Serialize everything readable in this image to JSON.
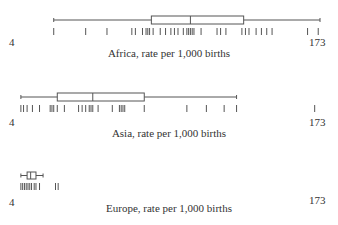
{
  "chart_data": [
    {
      "type": "boxplot",
      "title": "Africa, rate per 1,000 births",
      "axis_min": 4,
      "axis_max": 173,
      "box": {
        "min": 23,
        "q1": 78,
        "median": 100,
        "q3": 130,
        "max": 173
      },
      "rug": [
        23,
        41,
        53,
        67,
        69,
        73,
        75,
        76,
        77,
        79,
        83,
        86,
        89,
        91,
        93,
        96,
        98,
        99,
        100,
        101,
        102,
        106,
        115,
        117,
        120,
        129,
        131,
        133,
        137,
        140,
        143,
        146,
        166,
        172
      ]
    },
    {
      "type": "boxplot",
      "title": "Asia, rate per 1,000 births",
      "axis_min": 4,
      "axis_max": 173,
      "box": {
        "min": 4.5,
        "q1": 25,
        "median": 45,
        "q3": 74,
        "max": 126
      },
      "outliers": [
        170
      ],
      "rug": [
        4.5,
        6,
        8,
        11,
        15,
        21,
        22,
        23,
        25,
        29,
        37,
        39,
        41,
        43,
        44,
        45,
        48,
        56,
        60,
        61,
        62,
        63,
        74,
        98,
        109,
        119,
        126,
        170
      ]
    },
    {
      "type": "boxplot",
      "title": "Europe, rate per 1,000 births",
      "axis_min": 4,
      "axis_max": 173,
      "box": {
        "min": 4.5,
        "q1": 8,
        "median": 10,
        "q3": 13,
        "max": 17
      },
      "rug": [
        4.5,
        5.5,
        6.5,
        7.5,
        8.5,
        9.5,
        10.5,
        12,
        13,
        15,
        24,
        25.5
      ]
    }
  ],
  "labels": {
    "africa": {
      "min": "4",
      "max": "173",
      "caption": "Africa, rate per 1,000 births"
    },
    "asia": {
      "min": "4",
      "max": "173",
      "caption": "Asia, rate per 1,000 births"
    },
    "europe": {
      "min": "4",
      "max": "173",
      "caption": "Europe, rate per 1,000 births"
    }
  }
}
